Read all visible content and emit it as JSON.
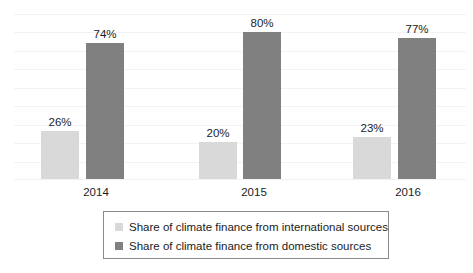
{
  "chart_data": {
    "type": "bar",
    "title": "",
    "subtitle": "",
    "xlabel": "",
    "ylabel": "",
    "ylim": [
      0,
      90
    ],
    "grid": true,
    "grid_values": [
      0,
      10,
      20,
      30,
      40,
      50,
      60,
      70,
      80,
      90
    ],
    "legend_position": "bottom",
    "categories": [
      "2014",
      "2015",
      "2016"
    ],
    "value_suffix": "%",
    "series": [
      {
        "name": "Share of climate finance from international sources",
        "color": "#d9d9d9",
        "values": [
          26,
          20,
          23
        ],
        "labels": [
          "26%",
          "20%",
          "23%"
        ]
      },
      {
        "name": "Share of climate finance from domestic sources",
        "color": "#808080",
        "values": [
          74,
          80,
          77
        ],
        "labels": [
          "74%",
          "80%",
          "77%"
        ]
      }
    ]
  },
  "legend": {
    "items": [
      {
        "label": "Share of climate finance from international sources",
        "color": "#d9d9d9"
      },
      {
        "label": "Share of climate finance from domestic sources",
        "color": "#808080"
      }
    ]
  },
  "axis": {
    "category_labels": [
      "2014",
      "2015",
      "2016"
    ]
  },
  "caption": {
    "text": ""
  }
}
